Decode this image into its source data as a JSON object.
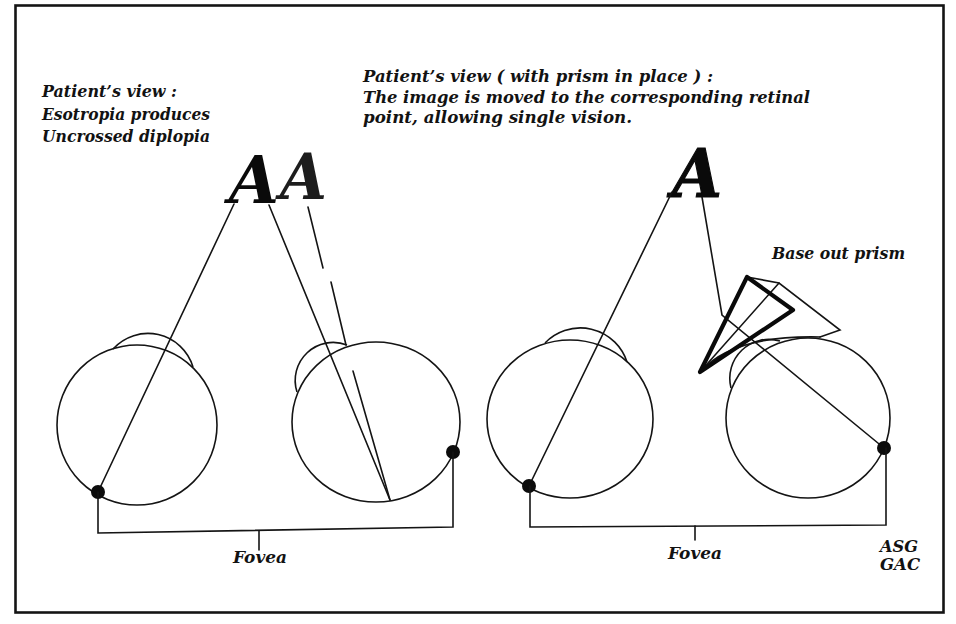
{
  "left_panel": {
    "caption": [
      "Patient’s view :",
      "Esotropia produces",
      "Uncrossed diplopia"
    ],
    "images": [
      "A",
      "A"
    ],
    "fovea_label": "Fovea"
  },
  "right_panel": {
    "caption": [
      "Patient’s view ( with prism in place ) :",
      "The image is moved to the corresponding retinal",
      "point, allowing single vision."
    ],
    "image": "A",
    "prism_label": "Base out prism",
    "fovea_label": "Fovea"
  },
  "credits": [
    "ASG",
    "GAC"
  ],
  "colors": {
    "ink": "#141414",
    "background": "#ffffff"
  }
}
